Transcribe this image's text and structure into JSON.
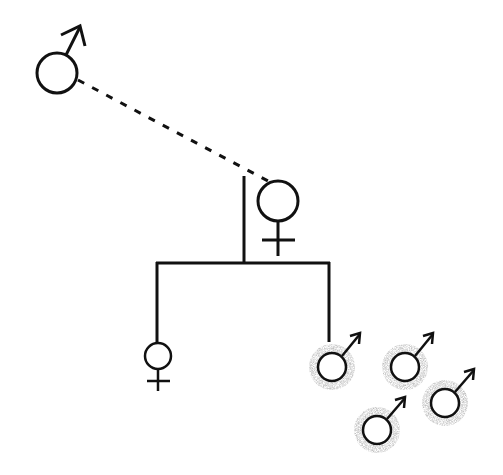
{
  "diagram": {
    "type": "pedigree",
    "colors": {
      "line": "#111111",
      "background": "#ffffff",
      "halo": "#9a9a9a"
    },
    "individuals": [
      {
        "id": "father",
        "sex": "male",
        "shaded": false,
        "cx": 57,
        "cy": 73,
        "r": 20
      },
      {
        "id": "mother",
        "sex": "female",
        "shaded": false,
        "cx": 278,
        "cy": 201,
        "r": 20
      },
      {
        "id": "daughter",
        "sex": "female",
        "shaded": false,
        "cx": 158,
        "cy": 356,
        "r": 13
      },
      {
        "id": "son",
        "sex": "male",
        "shaded": true,
        "cx": 332,
        "cy": 367,
        "r": 14
      },
      {
        "id": "male-2",
        "sex": "male",
        "shaded": true,
        "cx": 405,
        "cy": 367,
        "r": 14
      },
      {
        "id": "male-3",
        "sex": "male",
        "shaded": true,
        "cx": 377,
        "cy": 430,
        "r": 14
      },
      {
        "id": "male-4",
        "sex": "male",
        "shaded": true,
        "cx": 445,
        "cy": 403,
        "r": 14
      }
    ],
    "relationships": [
      {
        "type": "dashed-union",
        "from": "father",
        "to": "mother"
      },
      {
        "type": "descent",
        "parents": [
          "father",
          "mother"
        ],
        "children": [
          "daughter",
          "son"
        ]
      }
    ]
  }
}
